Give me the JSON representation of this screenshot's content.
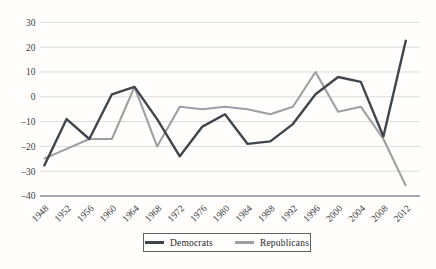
{
  "chart_data": {
    "type": "line",
    "title": "",
    "xlabel": "",
    "ylabel": "",
    "ylim": [
      -40,
      30
    ],
    "grid": true,
    "legend_position": "bottom-center",
    "categories": [
      1948,
      1952,
      1956,
      1960,
      1964,
      1968,
      1972,
      1976,
      1980,
      1984,
      1988,
      1992,
      1996,
      2000,
      2004,
      2008,
      2012
    ],
    "yticks": [
      {
        "label": "30",
        "value": 30
      },
      {
        "label": "20",
        "value": 20
      },
      {
        "label": "10",
        "value": 10
      },
      {
        "label": "0",
        "value": 0
      },
      {
        "label": "–10",
        "value": -10
      },
      {
        "label": "–20",
        "value": -20
      },
      {
        "label": "–30",
        "value": -30
      },
      {
        "label": "–40",
        "value": -40
      }
    ],
    "series": [
      {
        "name": "Democrats",
        "color": "#3f454c",
        "values": [
          -28,
          -9,
          -17,
          1,
          4,
          -9,
          -24,
          -12,
          -7,
          -19,
          -18,
          -11,
          1,
          8,
          6,
          -16,
          23
        ]
      },
      {
        "name": "Republicans",
        "color": "#9da0a3",
        "values": [
          -25,
          -21,
          -17,
          -17,
          4,
          -20,
          -4,
          -5,
          -4,
          -5,
          -7,
          -4,
          10,
          -6,
          -4,
          -17,
          -36
        ]
      }
    ]
  },
  "colors": {
    "gridline": "#dbdbdb",
    "axis_line": "#8a8d90",
    "tick_text": "#3a3c3e",
    "legend_border": "#5f6164"
  }
}
